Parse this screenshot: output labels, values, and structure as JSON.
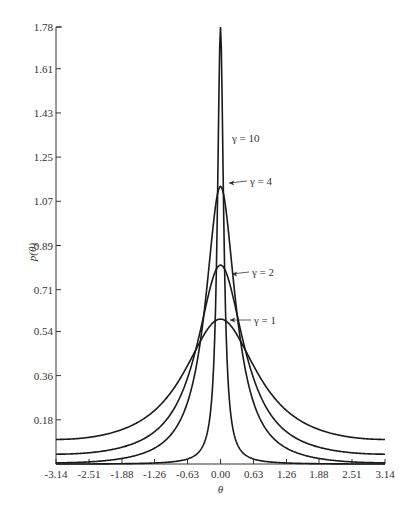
{
  "chart_data": {
    "type": "line",
    "title": "",
    "xlabel": "θ",
    "ylabel": "p(θ)",
    "xlim": [
      -3.14,
      3.14
    ],
    "ylim": [
      0,
      1.78
    ],
    "grid": false,
    "x_ticks": [
      "-3.14",
      "-2.51",
      "-1.88",
      "-1.26",
      "-0.63",
      "0.00",
      "0.63",
      "1.26",
      "1.88",
      "2.51",
      "3.14"
    ],
    "y_ticks": [
      "0.18",
      "0.36",
      "0.54",
      "0.71",
      "0.89",
      "1.07",
      "1.25",
      "1.43",
      "1.61",
      "1.78"
    ],
    "x": [
      -3.14,
      -2.51,
      -1.88,
      -1.26,
      -0.94,
      -0.63,
      -0.31,
      0.0,
      0.31,
      0.63,
      0.94,
      1.26,
      1.88,
      2.51,
      3.14
    ],
    "series": [
      {
        "name": "γ = 1",
        "peak": 0.59,
        "values": [
          0.1,
          0.11,
          0.14,
          0.22,
          0.3,
          0.4,
          0.53,
          0.59,
          0.53,
          0.4,
          0.3,
          0.22,
          0.14,
          0.11,
          0.1
        ]
      },
      {
        "name": "γ = 2",
        "peak": 0.81,
        "values": [
          0.04,
          0.045,
          0.06,
          0.12,
          0.21,
          0.35,
          0.65,
          0.81,
          0.65,
          0.35,
          0.21,
          0.12,
          0.06,
          0.045,
          0.04
        ]
      },
      {
        "name": "γ = 4",
        "peak": 1.13,
        "values": [
          0.005,
          0.006,
          0.01,
          0.03,
          0.09,
          0.25,
          0.75,
          1.13,
          0.75,
          0.25,
          0.09,
          0.03,
          0.01,
          0.006,
          0.005
        ]
      },
      {
        "name": "γ = 10",
        "peak": 1.78,
        "values": [
          0.0,
          0.0,
          0.0,
          0.0,
          0.002,
          0.02,
          0.55,
          1.78,
          0.55,
          0.02,
          0.002,
          0.0,
          0.0,
          0.0,
          0.0
        ]
      }
    ],
    "annotations": [
      {
        "text": "γ = 10",
        "arrow": false
      },
      {
        "text": "γ = 4",
        "arrow": true
      },
      {
        "text": "γ = 2",
        "arrow": true
      },
      {
        "text": "γ = 1",
        "arrow": true
      }
    ]
  }
}
